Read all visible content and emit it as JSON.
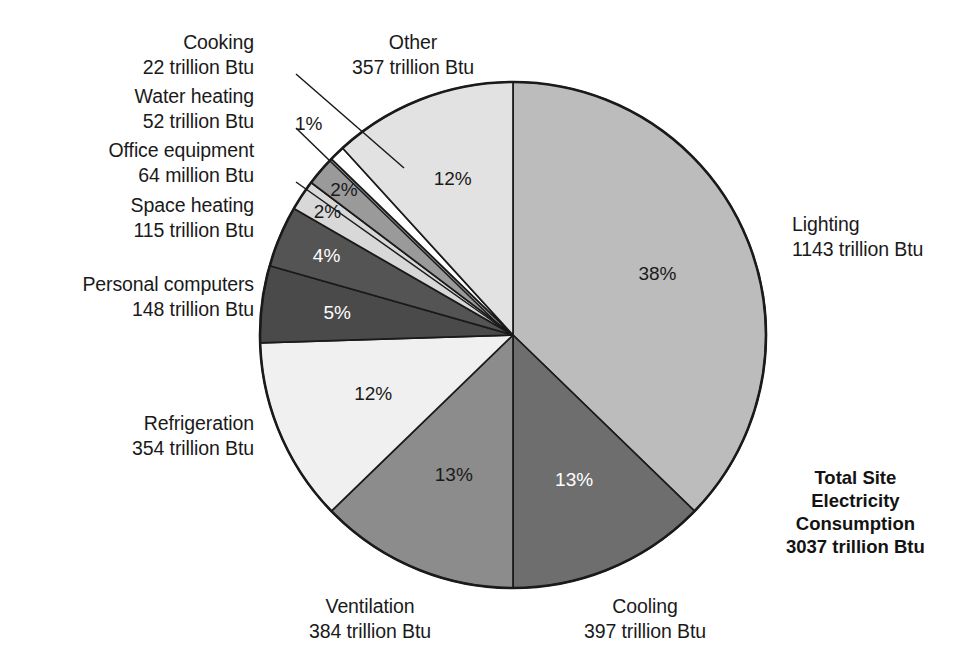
{
  "chart_data": {
    "type": "pie",
    "title": "",
    "total_label": [
      "Total Site",
      "Electricity",
      "Consumption",
      "3037 trillion Btu"
    ],
    "total_value": 3037,
    "total_units": "trillion Btu",
    "legend_position": "callout-labels",
    "start_angle_deg": 0,
    "direction": "clockwise",
    "categories": [
      "Lighting",
      "Cooling",
      "Ventilation",
      "Refrigeration",
      "Personal computers",
      "Space heating",
      "Office equipment",
      "Water heating",
      "Cooking",
      "Other"
    ],
    "values": [
      1143,
      397,
      384,
      354,
      148,
      115,
      64,
      52,
      22,
      357
    ],
    "percent": [
      38,
      13,
      13,
      12,
      5,
      4,
      2,
      2,
      1,
      12
    ],
    "slices": [
      {
        "name": "Lighting",
        "value": 1143,
        "unit": "trillion Btu",
        "value_text": "1143 trillion Btu",
        "pct": 38,
        "pct_text": "38%",
        "color": "#bcbcbc",
        "pct_color": "#1a1a1a"
      },
      {
        "name": "Cooling",
        "value": 397,
        "unit": "trillion Btu",
        "value_text": "397 trillion Btu",
        "pct": 13,
        "pct_text": "13%",
        "color": "#6e6e6e",
        "pct_color": "#ffffff"
      },
      {
        "name": "Ventilation",
        "value": 384,
        "unit": "trillion Btu",
        "value_text": "384 trillion Btu",
        "pct": 13,
        "pct_text": "13%",
        "color": "#8c8c8c",
        "pct_color": "#1a1a1a"
      },
      {
        "name": "Refrigeration",
        "value": 354,
        "unit": "trillion Btu",
        "value_text": "354 trillion Btu",
        "pct": 12,
        "pct_text": "12%",
        "color": "#f0f0f0",
        "pct_color": "#1a1a1a"
      },
      {
        "name": "Personal computers",
        "value": 148,
        "unit": "trillion Btu",
        "value_text": "148 trillion Btu",
        "pct": 5,
        "pct_text": "5%",
        "color": "#4a4a4a",
        "pct_color": "#ffffff"
      },
      {
        "name": "Space heating",
        "value": 115,
        "unit": "trillion Btu",
        "value_text": "115 trillion Btu",
        "pct": 4,
        "pct_text": "4%",
        "color": "#545454",
        "pct_color": "#ffffff"
      },
      {
        "name": "Office equipment",
        "value": 64,
        "unit": "million Btu",
        "value_text": "64 million Btu",
        "pct": 2,
        "pct_text": "2%",
        "color": "#d8d8d8",
        "pct_color": "#1a1a1a"
      },
      {
        "name": "Water heating",
        "value": 52,
        "unit": "trillion Btu",
        "value_text": "52 trillion Btu",
        "pct": 2,
        "pct_text": "2%",
        "color": "#9a9a9a",
        "pct_color": "#1a1a1a"
      },
      {
        "name": "Cooking",
        "value": 22,
        "unit": "trillion Btu",
        "value_text": "22 trillion Btu",
        "pct": 1,
        "pct_text": "1%",
        "color": "#ffffff",
        "pct_color": "#1a1a1a"
      },
      {
        "name": "Other",
        "value": 357,
        "unit": "trillion Btu",
        "value_text": "357 trillion Btu",
        "pct": 12,
        "pct_text": "12%",
        "color": "#e2e2e2",
        "pct_color": "#1a1a1a"
      }
    ]
  },
  "labels": {
    "cooking": {
      "name": "Cooking",
      "value": "22 trillion Btu"
    },
    "water_heating": {
      "name": "Water heating",
      "value": "52 trillion Btu"
    },
    "office_equipment": {
      "name": "Office equipment",
      "value": "64 million Btu"
    },
    "space_heating": {
      "name": "Space heating",
      "value": "115 trillion Btu"
    },
    "personal_computers": {
      "name": "Personal computers",
      "value": "148 trillion Btu"
    },
    "refrigeration": {
      "name": "Refrigeration",
      "value": "354 trillion Btu"
    },
    "other": {
      "name": "Other",
      "value": "357 trillion Btu"
    },
    "lighting": {
      "name": "Lighting",
      "value": "1143 trillion Btu"
    },
    "ventilation": {
      "name": "Ventilation",
      "value": "384 trillion Btu"
    },
    "cooling": {
      "name": "Cooling",
      "value": "397 trillion Btu"
    }
  },
  "percent_labels": {
    "lighting": "38%",
    "cooling": "13%",
    "ventilation": "13%",
    "refrigeration": "12%",
    "personal_computers": "5%",
    "space_heating": "4%",
    "office_equipment": "2%",
    "water_heating": "2%",
    "cooking": "1%",
    "other": "12%"
  },
  "total": {
    "line1": "Total Site",
    "line2": "Electricity",
    "line3": "Consumption",
    "line4": "3037 trillion Btu"
  },
  "colors": {
    "outline": "#1a1a1a",
    "background": "#ffffff",
    "leader_line": "#1a1a1a"
  }
}
